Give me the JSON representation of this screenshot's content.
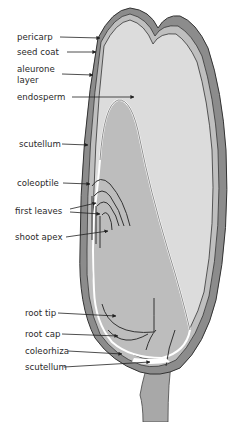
{
  "diagram": {
    "colors": {
      "endosperm": "#dcdcdc",
      "embryo": "#bdbdbd",
      "pericarp": "#8c8c8c",
      "outline": "#333333",
      "stalk": "#a8a8a8"
    },
    "labels": [
      {
        "id": "pericarp",
        "text": "pericarp"
      },
      {
        "id": "seed_coat",
        "text": "seed coat"
      },
      {
        "id": "aleurone_1",
        "text": "aleurone"
      },
      {
        "id": "aleurone_2",
        "text": "layer"
      },
      {
        "id": "endosperm",
        "text": "endosperm"
      },
      {
        "id": "scutellum_top",
        "text": "scutellum"
      },
      {
        "id": "coleoptile",
        "text": "coleoptile"
      },
      {
        "id": "first_leaves",
        "text": "first leaves"
      },
      {
        "id": "shoot_apex",
        "text": "shoot  apex"
      },
      {
        "id": "root_tip",
        "text": "root tip"
      },
      {
        "id": "root_cap",
        "text": "root cap"
      },
      {
        "id": "coleorhiza",
        "text": "coleorhiza"
      },
      {
        "id": "scutellum_bottom",
        "text": "scutellum"
      }
    ]
  }
}
